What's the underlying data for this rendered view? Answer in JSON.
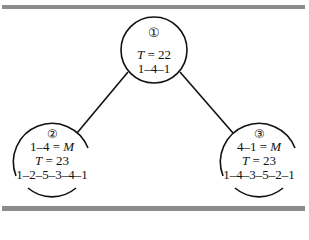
{
  "diagram": {
    "type": "tree",
    "nodes": [
      {
        "id": "1",
        "badge": "①",
        "lines": [
          "",
          "T = 22",
          "1–4–1"
        ],
        "T_label": "T",
        "T_value": "22",
        "route": "1–4–1"
      },
      {
        "id": "2",
        "badge": "②",
        "constraint": "1–4 = M",
        "constraint_lhs": "1–4",
        "constraint_rhs": "M",
        "T_label": "T",
        "T_value": "23",
        "route": "1–2–5–3–4–1"
      },
      {
        "id": "3",
        "badge": "③",
        "constraint": "4–1 = M",
        "constraint_lhs": "4–1",
        "constraint_rhs": "M",
        "T_label": "T",
        "T_value": "23",
        "route": "1–4–3–5–2–1"
      }
    ],
    "edges": [
      {
        "from": "1",
        "to": "2"
      },
      {
        "from": "1",
        "to": "3"
      }
    ],
    "colors": {
      "bar": "#8c8c8c",
      "stroke": "#111111"
    }
  }
}
